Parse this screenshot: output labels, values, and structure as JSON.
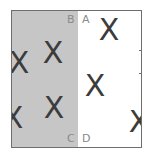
{
  "diagram": {
    "regions": [
      {
        "name": "left-region",
        "fill": "#c6c6c6"
      },
      {
        "name": "right-region",
        "fill": "#ffffff"
      }
    ],
    "corner_labels": {
      "top_left_of_divider": "B",
      "top_right_of_divider": "A",
      "bottom_left_of_divider": "C",
      "bottom_right_of_divider": "D"
    },
    "marks": [
      {
        "symbol": "X",
        "region": "left",
        "x": 7,
        "y": 52
      },
      {
        "symbol": "X",
        "region": "left",
        "x": 41,
        "y": 42
      },
      {
        "symbol": "X",
        "region": "left",
        "x": 42,
        "y": 97
      },
      {
        "symbol": "X",
        "region": "left",
        "x": 1,
        "y": 107
      },
      {
        "symbol": "X",
        "region": "right",
        "x": 97,
        "y": 19
      },
      {
        "symbol": "X",
        "region": "right",
        "x": 83,
        "y": 75
      },
      {
        "symbol": "X",
        "region": "right",
        "x": 127,
        "y": 111
      }
    ],
    "border_color": "#6e6e6e",
    "mark_color": "#3c3c3c",
    "label_color": "#8a8a8a"
  }
}
